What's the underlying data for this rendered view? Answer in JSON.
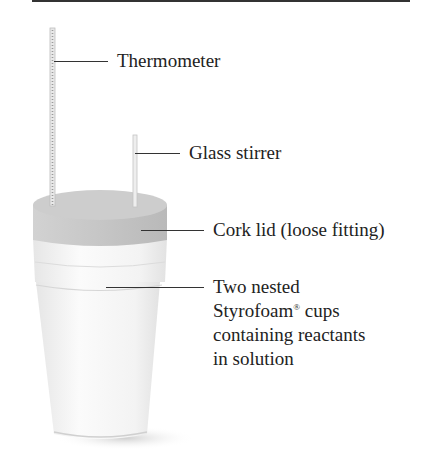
{
  "figure": {
    "labels": {
      "thermometer": "Thermometer",
      "stirrer": "Glass stirrer",
      "lid": "Cork lid (loose fitting)",
      "cups_line1": "Two nested",
      "cups_line2_pre": "Styrofoam",
      "cups_line2_mark": "®",
      "cups_line2_post": " cups",
      "cups_line3": "containing reactants",
      "cups_line4": "in solution"
    },
    "colors": {
      "text": "#222222",
      "cork": "#c9c9c9",
      "cup": "#f4f4f4",
      "shadow": "#d8d8d8"
    }
  }
}
